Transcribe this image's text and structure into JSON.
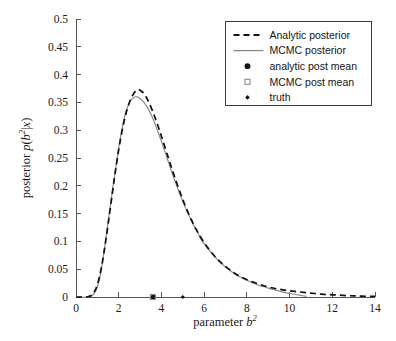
{
  "chart_data": {
    "type": "line",
    "title": "",
    "xlabel": "parameter b^2",
    "ylabel": "posterior p(b^2|x)",
    "xlim": [
      0,
      14
    ],
    "ylim": [
      0,
      0.5
    ],
    "grid": false,
    "xticks": [
      "0",
      "2",
      "4",
      "6",
      "8",
      "10",
      "12",
      "14"
    ],
    "xtick_values": [
      0,
      2,
      4,
      6,
      8,
      10,
      12,
      14
    ],
    "yticks": [
      "0",
      "0.05",
      "0.1",
      "0.15",
      "0.2",
      "0.25",
      "0.3",
      "0.35",
      "0.4",
      "0.45",
      "0.5"
    ],
    "ytick_values": [
      0,
      0.05,
      0.1,
      0.15,
      0.2,
      0.25,
      0.3,
      0.35,
      0.4,
      0.45,
      0.5
    ],
    "legend_position": "upper right",
    "series": [
      {
        "name": "Analytic posterior",
        "style": "dashed",
        "color": "#111111",
        "x": [
          0.0,
          0.3,
          0.6,
          0.8,
          1.0,
          1.2,
          1.4,
          1.6,
          1.8,
          2.0,
          2.2,
          2.4,
          2.6,
          2.8,
          2.9,
          3.0,
          3.2,
          3.4,
          3.6,
          3.8,
          4.0,
          4.3,
          4.6,
          5.0,
          5.4,
          5.8,
          6.2,
          6.6,
          7.0,
          7.5,
          8.0,
          8.5,
          9.0,
          9.5,
          10.0,
          10.5,
          11.0,
          11.5,
          12.0,
          13.0,
          14.0
        ],
        "y": [
          0.0,
          0.0,
          0.001,
          0.006,
          0.022,
          0.055,
          0.103,
          0.158,
          0.214,
          0.265,
          0.307,
          0.338,
          0.359,
          0.371,
          0.373,
          0.372,
          0.365,
          0.351,
          0.333,
          0.312,
          0.289,
          0.253,
          0.218,
          0.175,
          0.139,
          0.11,
          0.087,
          0.069,
          0.055,
          0.041,
          0.031,
          0.024,
          0.018,
          0.014,
          0.011,
          0.009,
          0.007,
          0.005,
          0.004,
          0.002,
          0.001
        ]
      },
      {
        "name": "MCMC posterior",
        "style": "solid",
        "color": "#8a8a8a",
        "x": [
          0.0,
          0.6,
          0.9,
          1.1,
          1.3,
          1.5,
          1.7,
          1.9,
          2.1,
          2.3,
          2.5,
          2.7,
          2.85,
          3.0,
          3.2,
          3.4,
          3.6,
          3.8,
          4.0,
          4.3,
          4.6,
          5.0,
          5.4,
          5.75,
          5.85,
          6.2,
          6.6,
          7.0,
          7.5,
          8.0,
          8.5,
          9.0,
          9.4,
          9.8,
          10.2,
          10.5,
          10.8
        ],
        "y": [
          0.0,
          0.0,
          0.009,
          0.033,
          0.078,
          0.134,
          0.19,
          0.243,
          0.291,
          0.328,
          0.35,
          0.359,
          0.36,
          0.357,
          0.349,
          0.337,
          0.321,
          0.301,
          0.28,
          0.246,
          0.212,
          0.172,
          0.137,
          0.112,
          0.104,
          0.086,
          0.068,
          0.054,
          0.04,
          0.03,
          0.022,
          0.016,
          0.012,
          0.008,
          0.005,
          0.003,
          0.001
        ]
      }
    ],
    "markers": [
      {
        "name": "analytic post mean",
        "x": 3.62,
        "y": 0.0,
        "shape": "filled-circle",
        "color": "#111111",
        "size": 5.2
      },
      {
        "name": "MCMC post mean",
        "x": 3.6,
        "y": 0.0,
        "shape": "open-square",
        "color": "#8a8a8a",
        "size": 5.0
      },
      {
        "name": "truth",
        "x": 5.0,
        "y": 0.0,
        "shape": "filled-diamond",
        "color": "#111111",
        "size": 4.2
      }
    ]
  },
  "axes": {
    "xlabel_prefix": "parameter ",
    "xlabel_var": "b",
    "xlabel_sup": "2",
    "ylabel_prefix": "posterior ",
    "ylabel_p": "p",
    "ylabel_open": "(",
    "ylabel_var": "b",
    "ylabel_sup": "2",
    "ylabel_bar": "|",
    "ylabel_x": "x",
    "ylabel_close": ")"
  },
  "legend": {
    "items": [
      {
        "label": "Analytic posterior",
        "marker": "dashed-line"
      },
      {
        "label": "MCMC posterior",
        "marker": "solid-line"
      },
      {
        "label": "analytic post mean",
        "marker": "filled-circle"
      },
      {
        "label": "MCMC post mean",
        "marker": "open-square"
      },
      {
        "label": "truth",
        "marker": "filled-diamond"
      }
    ]
  },
  "colors": {
    "analytic": "#111111",
    "mcmc": "#8a8a8a",
    "axis": "#555555",
    "background": "#ffffff"
  }
}
